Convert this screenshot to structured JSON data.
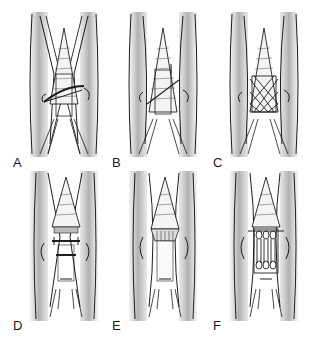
{
  "figure": {
    "panels": [
      {
        "id": "A",
        "label": "A",
        "technique": "oblique suture with core stitch"
      },
      {
        "id": "B",
        "label": "B",
        "technique": "oblique single-strand suture"
      },
      {
        "id": "C",
        "label": "C",
        "technique": "cross-stitch lattice suture"
      },
      {
        "id": "D",
        "label": "D",
        "technique": "transverse horizontal sutures"
      },
      {
        "id": "E",
        "label": "E",
        "technique": "tendon end approximated"
      },
      {
        "id": "F",
        "label": "F",
        "technique": "looped multi-strand suture"
      }
    ]
  },
  "colors": {
    "background": "#ffffff",
    "skin_band": "#b8b8b8",
    "ink": "#1e1e1e",
    "tendon_fill": "#f4f4f4"
  }
}
